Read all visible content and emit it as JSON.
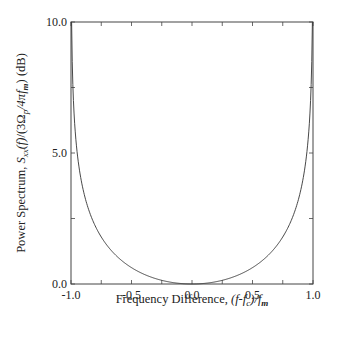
{
  "chart_data": {
    "type": "line",
    "title": "",
    "xlabel": "Frequency Difference, (f-f_c)/f_m",
    "ylabel": "Power Spectrum, S_xx(f)/(3Ω_p/4πf_m) (dB)",
    "xlim": [
      -1.0,
      1.0
    ],
    "ylim": [
      0.0,
      10.0
    ],
    "x_ticks": [
      "-1.0",
      "-0.5",
      "0.0",
      "0.5",
      "1.0"
    ],
    "y_ticks": [
      "0.0",
      "5.0",
      "10.0"
    ],
    "grid": false,
    "legend": null,
    "series": [
      {
        "name": "Power Spectrum",
        "x": [
          -0.999,
          -0.995,
          -0.99,
          -0.98,
          -0.97,
          -0.95,
          -0.92,
          -0.9,
          -0.85,
          -0.8,
          -0.7,
          -0.6,
          -0.5,
          -0.4,
          -0.3,
          -0.2,
          -0.1,
          0.0,
          0.1,
          0.2,
          0.3,
          0.4,
          0.5,
          0.6,
          0.7,
          0.8,
          0.85,
          0.9,
          0.92,
          0.95,
          0.97,
          0.98,
          0.99,
          0.995,
          0.999
        ],
        "y": [
          10.0,
          10.0,
          8.5,
          7.0,
          6.1,
          5.1,
          4.1,
          3.6,
          2.8,
          2.2,
          1.5,
          1.0,
          0.62,
          0.38,
          0.2,
          0.09,
          0.02,
          0.0,
          0.02,
          0.09,
          0.2,
          0.38,
          0.62,
          1.0,
          1.5,
          2.2,
          2.8,
          3.6,
          4.1,
          5.1,
          6.1,
          7.0,
          8.5,
          10.0,
          10.0
        ]
      }
    ]
  },
  "labels": {
    "x_prefix": "Frequency Difference, ",
    "y_prefix": "Power Spectrum, "
  }
}
